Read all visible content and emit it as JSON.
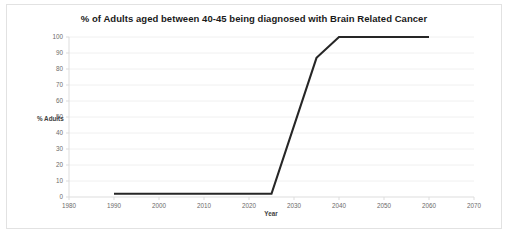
{
  "chart_data": {
    "type": "line",
    "title": "% of Adults aged between 40-45 being diagnosed with Brain Related Cancer",
    "xlabel": "Year",
    "ylabel": "% Adults",
    "xlim": [
      1980,
      2070
    ],
    "ylim": [
      0,
      100
    ],
    "xticks": [
      1980,
      1990,
      2000,
      2010,
      2020,
      2030,
      2040,
      2050,
      2060,
      2070
    ],
    "yticks": [
      0,
      10,
      20,
      30,
      40,
      50,
      60,
      70,
      80,
      90,
      100
    ],
    "grid": "horizontal",
    "legend": "none",
    "series": [
      {
        "name": "% Adults diagnosed",
        "color": "#262626",
        "x": [
          1990,
          2025,
          2035,
          2040,
          2060
        ],
        "values": [
          2,
          2,
          87,
          100,
          100
        ]
      }
    ]
  }
}
